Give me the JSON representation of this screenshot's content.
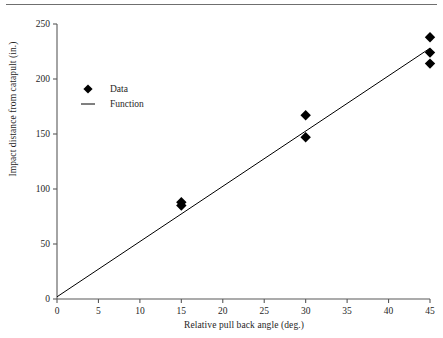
{
  "chart_data": {
    "type": "scatter",
    "title": "",
    "xlabel": "Relative pull back angle (deg.)",
    "ylabel": "Impact distance from catapult (in.)",
    "xlim": [
      0,
      45
    ],
    "ylim": [
      0,
      250
    ],
    "xticks": [
      0,
      5,
      10,
      15,
      20,
      25,
      30,
      35,
      40,
      45
    ],
    "yticks": [
      0,
      50,
      100,
      150,
      200,
      250
    ],
    "xtick_labels": [
      "0",
      "5",
      "10",
      "15",
      "20",
      "25",
      "30",
      "35",
      "40",
      "45"
    ],
    "ytick_labels": [
      "0",
      "50",
      "100",
      "150",
      "200",
      "250"
    ],
    "grid": false,
    "legend_position": "upper-left-inside",
    "series": [
      {
        "name": "Data",
        "type": "scatter",
        "marker": "diamond",
        "color": "#000000",
        "points": [
          {
            "x": 15,
            "y": 88
          },
          {
            "x": 15,
            "y": 85
          },
          {
            "x": 30,
            "y": 167
          },
          {
            "x": 30,
            "y": 147
          },
          {
            "x": 45,
            "y": 238
          },
          {
            "x": 45,
            "y": 224
          },
          {
            "x": 45,
            "y": 214
          }
        ]
      },
      {
        "name": "Function",
        "type": "line",
        "color": "#000000",
        "points": [
          {
            "x": 0,
            "y": 2
          },
          {
            "x": 45,
            "y": 228
          }
        ]
      }
    ]
  },
  "axes": {
    "x_title": "Relative pull back angle (deg.)",
    "y_title": "Impact distance from catapult (in.)"
  },
  "legend": {
    "items": [
      {
        "label": "Data",
        "marker": "diamond"
      },
      {
        "label": "Function",
        "marker": "line"
      }
    ]
  }
}
